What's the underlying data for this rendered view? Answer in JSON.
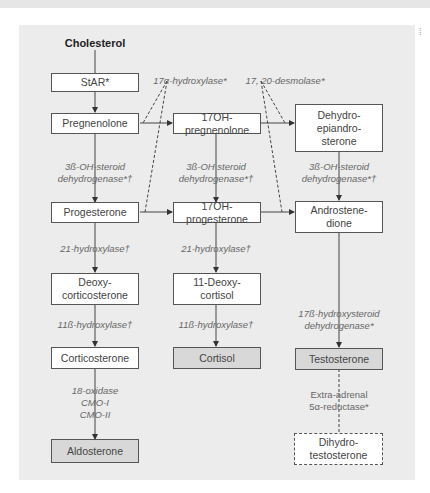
{
  "diagram": {
    "start": "Cholesterol",
    "nodes": {
      "star": "StAR*",
      "pregnenolone": "Pregnenolone",
      "oh_pregnenolone": "17OH-pregnenolone",
      "dhea": "Dehydro-\nepiandro-\nsterone",
      "progesterone": "Progesterone",
      "oh_progesterone": "17OH-progesterone",
      "androstenedione": "Androstene-\ndione",
      "deoxycorticosterone": "Deoxy-\ncorticosterone",
      "deoxycortisol": "11-Deoxy-\ncortisol",
      "corticosterone": "Corticosterone",
      "cortisol": "Cortisol",
      "testosterone": "Testosterone",
      "aldosterone": "Aldosterone",
      "dht": "Dihydro-\ntestosterone"
    },
    "enzymes": {
      "hydroxylase17a": "17α-hydroxylase*",
      "desmolase": "17, 20-desmolase*",
      "hsd3b_1": "3ß-OH-steroid\ndehydrogenase*†",
      "hsd3b_2": "3ß-OH steroid\ndehydrogenase*†",
      "hsd3b_3": "3ß-OH-steroid\ndehydrogenase*†",
      "hydroxylase21_1": "21-hydroxylase†",
      "hydroxylase21_2": "21-hydroxylase†",
      "hydroxylase11b_1": "11ß-hydroxylase†",
      "hydroxylase11b_2": "11ß-hydroxylase†",
      "hsd17b": "17ß-hydroxysteroid\ndehydrogenase*",
      "oxidase18": "18-oxidase\nCMO-I\nCMO-II",
      "reductase5a": "Extra-adrenal\n5α-reductase*"
    }
  }
}
